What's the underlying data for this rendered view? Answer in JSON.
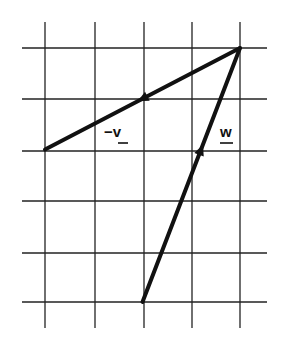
{
  "diagram": {
    "type": "vector-grid",
    "grid": {
      "columns": 5,
      "rows": 6
    },
    "vectors": [
      {
        "name": "neg-v",
        "label_prefix": "−",
        "label": "v",
        "from": [
          4,
          0
        ],
        "to": [
          0,
          2
        ],
        "arrow_at": 0.5,
        "color": "#111111"
      },
      {
        "name": "w",
        "label_prefix": "",
        "label": "w",
        "from": [
          2,
          5
        ],
        "to": [
          4,
          0
        ],
        "arrow_at": 0.6,
        "color": "#111111"
      }
    ]
  }
}
